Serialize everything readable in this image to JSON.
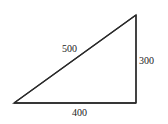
{
  "diagram": {
    "type": "right-triangle",
    "stroke_color": "#2a2a2a",
    "label_color": "#222222",
    "vertices": {
      "bottom_left": [
        14,
        103
      ],
      "bottom_right": [
        136,
        103
      ],
      "top_right": [
        136,
        15
      ]
    },
    "sides": {
      "hypotenuse": {
        "label": "500"
      },
      "base": {
        "label": "400"
      },
      "height": {
        "label": "300"
      }
    }
  }
}
